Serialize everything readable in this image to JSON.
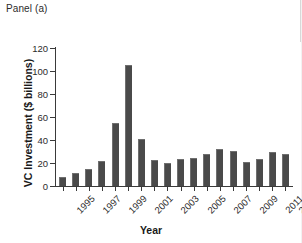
{
  "panel": {
    "label": "Panel (a)"
  },
  "chart_data": {
    "type": "bar",
    "title": "Panel (a)",
    "xlabel": "Year",
    "ylabel": "VC Investment ($ billions)",
    "ylim": [
      0,
      120
    ],
    "ytick_values": [
      0,
      20,
      40,
      60,
      80,
      100,
      120
    ],
    "ytick_labels": [
      "0",
      "20",
      "40",
      "60",
      "80",
      "100",
      "120"
    ],
    "grid": false,
    "legend": "none",
    "bar_color": "#4a4a4a",
    "categories": [
      "1995",
      "1996",
      "1997",
      "1998",
      "1999",
      "2000",
      "2001",
      "2002",
      "2003",
      "2004",
      "2005",
      "2006",
      "2007",
      "2008",
      "2009",
      "2010",
      "2011",
      "2012"
    ],
    "xtick_labels_shown": [
      "1995",
      "1997",
      "1999",
      "2001",
      "2003",
      "2005",
      "2007",
      "2009",
      "2011",
      "2012"
    ],
    "values": [
      8,
      11.5,
      15,
      21.5,
      55,
      105,
      41,
      22.5,
      20,
      23.5,
      24,
      28,
      32,
      30.5,
      21,
      23.5,
      30,
      27.5
    ]
  }
}
